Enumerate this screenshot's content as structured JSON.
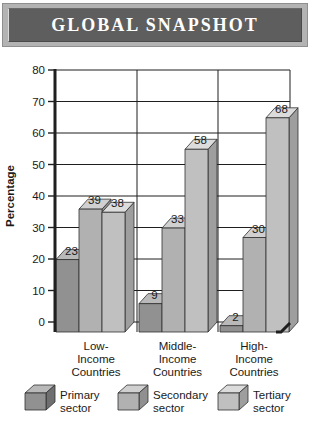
{
  "header": {
    "title": "GLOBAL SNAPSHOT",
    "panel_color": "#5e5e5e",
    "frame_color": "#b3b3b3",
    "text_color": "#ffffff"
  },
  "chart_data": {
    "type": "bar",
    "style": "3d",
    "title": "",
    "xlabel": "",
    "ylabel": "Percentage",
    "ylim": [
      0,
      80
    ],
    "ytick_step": 10,
    "grid": true,
    "legend_position": "bottom",
    "axis_color": "#1f1f1f",
    "label_color": "#1a1a1a",
    "categories": [
      "Low-\nIncome\nCountries",
      "Middle-\nIncome\nCountries",
      "High-\nIncome\nCountries"
    ],
    "series": [
      {
        "name": "Primary sector",
        "values": [
          23,
          9,
          2
        ],
        "colors": {
          "front": "#919191",
          "top": "#b9b9b9",
          "side": "#6f6f6f"
        }
      },
      {
        "name": "Secondary sector",
        "values": [
          39,
          33,
          30
        ],
        "colors": {
          "front": "#b1b1b1",
          "top": "#d0d0d0",
          "side": "#909090"
        }
      },
      {
        "name": "Tertiary sector",
        "values": [
          38,
          58,
          68
        ],
        "colors": {
          "front": "#c0c0c0",
          "top": "#dcdcdc",
          "side": "#9e9e9e"
        }
      }
    ],
    "legend": [
      {
        "lines": [
          "Primary",
          "sector"
        ]
      },
      {
        "lines": [
          "Secondary",
          "sector"
        ]
      },
      {
        "lines": [
          "Tertiary",
          "sector"
        ]
      }
    ]
  }
}
